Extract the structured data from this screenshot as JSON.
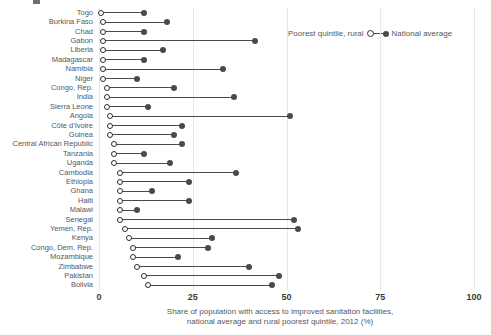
{
  "chart_data": {
    "type": "scatter",
    "subtype": "dumbbell",
    "title": "",
    "xlabel": "Share of population with access to improved sanitation facilities, national average and rural poorest quintile, 2012 (%)",
    "ylabel": "",
    "xlim": [
      0,
      100
    ],
    "xticks": [
      0,
      25,
      50,
      75,
      100
    ],
    "xtick_labels": [
      "0",
      "25",
      "50",
      "75",
      "100"
    ],
    "grid": true,
    "legend_position": "top-right",
    "categories": [
      "Togo",
      "Burkina Faso",
      "Chad",
      "Gabon",
      "Liberia",
      "Madagascar",
      "Namibia",
      "Niger",
      "Congo, Rep.",
      "India",
      "Sierra Leone",
      "Angola",
      "Côte d'Ivoire",
      "Guinea",
      "Central African Republic",
      "Tanzania",
      "Uganda",
      "Cambodia",
      "Ethiopia",
      "Ghana",
      "Haiti",
      "Malawi",
      "Senegal",
      "Yemen, Rep.",
      "Kenya",
      "Congo, Dem. Rep.",
      "Mozambique",
      "Zimbabwe",
      "Pakistan",
      "Bolivia"
    ],
    "series": [
      {
        "name": "Poorest quintile, rural",
        "marker": "open-circle",
        "color": "#2e2e2e",
        "values": [
          0.5,
          1.0,
          1.0,
          1.0,
          1.0,
          1.0,
          1.0,
          1.0,
          2.0,
          2.0,
          2.0,
          3.0,
          3.0,
          3.0,
          4.0,
          4.0,
          4.0,
          5.5,
          5.5,
          5.5,
          5.5,
          5.5,
          5.5,
          7.0,
          8.0,
          9.0,
          9.0,
          10.0,
          12.0,
          13.0
        ]
      },
      {
        "name": "National average",
        "marker": "filled-circle",
        "color": "#4a4a4a",
        "values": [
          12.0,
          18.0,
          12.0,
          41.5,
          17.0,
          12.0,
          33.0,
          10.0,
          20.0,
          36.0,
          13.0,
          51.0,
          22.0,
          20.0,
          22.0,
          12.0,
          19.0,
          36.5,
          24.0,
          14.0,
          24.0,
          10.0,
          52.0,
          53.0,
          30.0,
          29.0,
          21.0,
          40.0,
          48.0,
          46.0
        ]
      }
    ]
  },
  "axis": {
    "ticks": [
      "0",
      "25",
      "50",
      "75",
      "100"
    ],
    "title_line1": "Share of population with access to improved sanitation facilities,",
    "title_line2": "national average and rural poorest quintile, 2012 (%)"
  },
  "legend": {
    "left_label": "Poorest quintile, rural",
    "right_label": "National average"
  }
}
